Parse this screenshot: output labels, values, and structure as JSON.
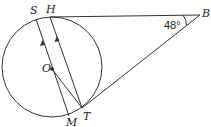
{
  "diagram": {
    "type": "circle-tangent-geometry",
    "circle": {
      "center_label": "O",
      "cx": 52,
      "cy": 67,
      "r": 50
    },
    "points": {
      "S": {
        "label": "S",
        "x": 36,
        "y": 19
      },
      "H": {
        "label": "H",
        "x": 50,
        "y": 17
      },
      "B": {
        "label": "B",
        "x": 200,
        "y": 15
      },
      "O": {
        "label": "O",
        "x": 52,
        "y": 69
      },
      "T": {
        "label": "T",
        "x": 82,
        "y": 108
      },
      "M": {
        "label": "M",
        "x": 69,
        "y": 116
      }
    },
    "angle": {
      "vertex": "B",
      "value": "48°"
    },
    "segments": [
      "HB",
      "TB",
      "SM",
      "HT",
      "OT"
    ],
    "parallel_marks": [
      "SM",
      "HT"
    ],
    "colors": {
      "stroke": "#333333",
      "text": "#222222",
      "background": "#ffffff"
    }
  }
}
